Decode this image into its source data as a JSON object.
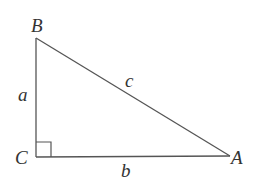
{
  "diagram": {
    "type": "right-triangle",
    "colors": {
      "stroke": "#555555",
      "text": "#333333",
      "background": "#ffffff"
    },
    "vertices": [
      {
        "id": "B",
        "label": "B",
        "x": 36,
        "y": 38
      },
      {
        "id": "C",
        "label": "C",
        "x": 36,
        "y": 157
      },
      {
        "id": "A",
        "label": "A",
        "x": 230,
        "y": 156
      }
    ],
    "sides": [
      {
        "id": "a",
        "label": "a",
        "from": "B",
        "to": "C"
      },
      {
        "id": "b",
        "label": "b",
        "from": "C",
        "to": "A"
      },
      {
        "id": "c",
        "label": "c",
        "from": "B",
        "to": "A"
      }
    ],
    "right_angle_at": "C"
  }
}
